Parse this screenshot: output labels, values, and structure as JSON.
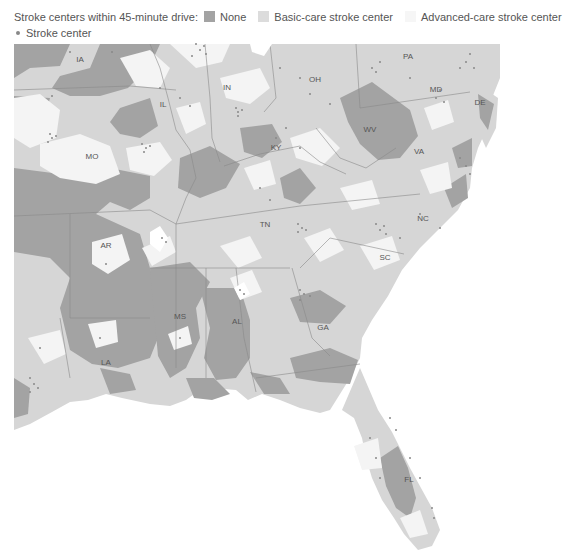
{
  "legend": {
    "title": "Stroke centers within 45-minute drive:",
    "items": [
      {
        "label": "None",
        "color": "#a3a3a3"
      },
      {
        "label": "Basic-care stroke center",
        "color": "#dcdcdc"
      },
      {
        "label": "Advanced-care stroke center",
        "color": "#f6f6f6"
      }
    ],
    "marker": {
      "label": "Stroke center",
      "color": "#888888"
    }
  },
  "map": {
    "colors": {
      "none": "#a3a3a3",
      "basic": "#d6d6d6",
      "advanced": "#f4f4f4",
      "border": "#8a8a8a",
      "water": "#ffffff"
    },
    "states": [
      {
        "abbr": "IA",
        "x": 80,
        "y": 24
      },
      {
        "abbr": "IL",
        "x": 163,
        "y": 69
      },
      {
        "abbr": "IN",
        "x": 227,
        "y": 52
      },
      {
        "abbr": "OH",
        "x": 315,
        "y": 44
      },
      {
        "abbr": "PA",
        "x": 408,
        "y": 21
      },
      {
        "abbr": "MD",
        "x": 436,
        "y": 54
      },
      {
        "abbr": "DE",
        "x": 480,
        "y": 67
      },
      {
        "abbr": "WV",
        "x": 370,
        "y": 94
      },
      {
        "abbr": "VA",
        "x": 419,
        "y": 116
      },
      {
        "abbr": "KY",
        "x": 276,
        "y": 112
      },
      {
        "abbr": "MO",
        "x": 92,
        "y": 121
      },
      {
        "abbr": "TN",
        "x": 265,
        "y": 189
      },
      {
        "abbr": "NC",
        "x": 423,
        "y": 183
      },
      {
        "abbr": "SC",
        "x": 385,
        "y": 222
      },
      {
        "abbr": "AR",
        "x": 106,
        "y": 210
      },
      {
        "abbr": "MS",
        "x": 180,
        "y": 281
      },
      {
        "abbr": "AL",
        "x": 237,
        "y": 286
      },
      {
        "abbr": "GA",
        "x": 323,
        "y": 292
      },
      {
        "abbr": "LA",
        "x": 106,
        "y": 327
      },
      {
        "abbr": "FL",
        "x": 409,
        "y": 444
      }
    ]
  }
}
